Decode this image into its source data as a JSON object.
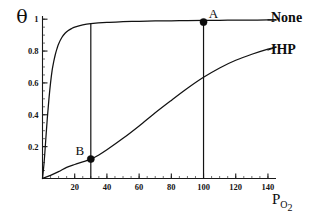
{
  "chart_data": {
    "type": "line",
    "title": "",
    "xlabel": "P",
    "xlabel_sub": "O",
    "xlabel_sub2": "2",
    "ylabel": "θ",
    "xlim": [
      0,
      145
    ],
    "ylim": [
      0,
      1.02
    ],
    "grid": false,
    "legend_position": "right-inline",
    "x_ticks": [
      20,
      40,
      60,
      80,
      100,
      120,
      140
    ],
    "x_tick_labels": [
      "20",
      "40",
      "60",
      "80",
      "100",
      "120",
      "140"
    ],
    "x_minor_step": 5,
    "y_ticks": [
      0.2,
      0.4,
      0.6,
      0.8,
      1
    ],
    "y_tick_labels": [
      "0.2",
      "0.4",
      "0.6",
      "0.8",
      "1"
    ],
    "y_minor_step": 0.05,
    "series": [
      {
        "name": "None",
        "label": "None",
        "description": "high oxygen affinity binding curve without IHP",
        "x": [
          0,
          1,
          2,
          3,
          4,
          5,
          6,
          7,
          8,
          9,
          10,
          12,
          14,
          16,
          18,
          20,
          25,
          30,
          40,
          50,
          60,
          70,
          80,
          90,
          100,
          110,
          120,
          130,
          140,
          145
        ],
        "y": [
          0,
          0.1,
          0.24,
          0.38,
          0.5,
          0.6,
          0.68,
          0.735,
          0.78,
          0.815,
          0.845,
          0.885,
          0.912,
          0.929,
          0.941,
          0.95,
          0.964,
          0.972,
          0.98,
          0.984,
          0.987,
          0.989,
          0.99,
          0.991,
          0.992,
          0.993,
          0.994,
          0.994,
          0.995,
          0.995
        ]
      },
      {
        "name": "IHP",
        "label": "IHP",
        "description": "low oxygen affinity sigmoidal binding curve with IHP",
        "x": [
          0,
          5,
          10,
          15,
          20,
          25,
          30,
          35,
          40,
          50,
          60,
          70,
          80,
          90,
          100,
          110,
          120,
          130,
          140,
          145
        ],
        "y": [
          0,
          0.02,
          0.043,
          0.07,
          0.088,
          0.104,
          0.122,
          0.148,
          0.18,
          0.252,
          0.33,
          0.412,
          0.49,
          0.566,
          0.635,
          0.694,
          0.742,
          0.78,
          0.812,
          0.825
        ]
      }
    ],
    "annotations": [
      {
        "label": "A",
        "x": 100,
        "y": 0.982,
        "series": "None",
        "marker": "filled-circle"
      },
      {
        "label": "B",
        "x": 30,
        "y": 0.122,
        "series": "IHP",
        "marker": "filled-circle"
      }
    ],
    "reference_lines": [
      {
        "x": 30,
        "orientation": "vertical",
        "from_y": 0,
        "to_y": 0.972
      },
      {
        "x": 100,
        "orientation": "vertical",
        "from_y": 0,
        "to_y": 0.982
      }
    ],
    "colors": {
      "axis": "#181818",
      "curve": "#121212",
      "marker": "#0d0d0d",
      "background": "#ffffff"
    }
  }
}
